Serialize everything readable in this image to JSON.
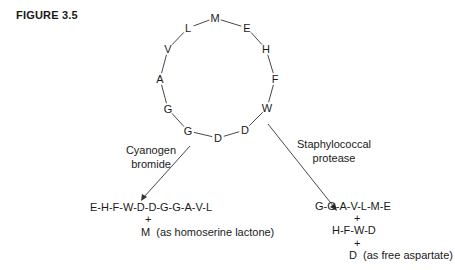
{
  "figure": {
    "title": "FIGURE 3.5"
  },
  "ring": {
    "residues": [
      {
        "id": "M",
        "x": 215,
        "y": 18
      },
      {
        "id": "E",
        "x": 247,
        "y": 28
      },
      {
        "id": "H",
        "x": 266,
        "y": 49
      },
      {
        "id": "F",
        "x": 275,
        "y": 79
      },
      {
        "id": "W",
        "x": 267,
        "y": 108
      },
      {
        "id": "D",
        "x": 245,
        "y": 130
      },
      {
        "id": "D",
        "x": 218,
        "y": 138
      },
      {
        "id": "G",
        "x": 188,
        "y": 131
      },
      {
        "id": "G",
        "x": 168,
        "y": 109
      },
      {
        "id": "A",
        "x": 160,
        "y": 79
      },
      {
        "id": "V",
        "x": 168,
        "y": 49
      },
      {
        "id": "L",
        "x": 188,
        "y": 28
      }
    ]
  },
  "cleavage": {
    "left": {
      "reagent_line1": "Cyanogen",
      "reagent_line2": "bromide",
      "product1": "E-H-F-W-D-D-G-G-A-V-L",
      "plus1": "+",
      "product2": "M  (as homoserine lactone)"
    },
    "right": {
      "reagent_line1": "Staphylococcal",
      "reagent_line2": "protease",
      "product1": "G-G-A-V-L-M-E",
      "plus1": "+",
      "product2": "H-F-W-D",
      "plus2": "+",
      "product3": "D  (as free aspartate)"
    }
  }
}
